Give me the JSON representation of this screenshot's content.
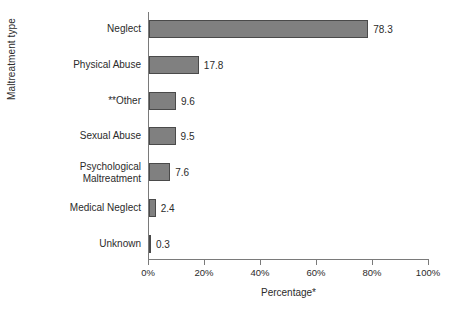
{
  "chart_data": {
    "type": "bar",
    "orientation": "horizontal",
    "title": "",
    "xlabel": "Percentage*",
    "ylabel": "Maltreatment type",
    "categories": [
      "Neglect",
      "Physical Abuse",
      "**Other",
      "Sexual Abuse",
      "Psychological\nMaltreatment",
      "Medical Neglect",
      "Unknown"
    ],
    "values": [
      78.3,
      17.8,
      9.6,
      9.5,
      7.6,
      2.4,
      0.3
    ],
    "value_labels": [
      "78.3",
      "17.8",
      "9.6",
      "9.5",
      "7.6",
      "2.4",
      "0.3"
    ],
    "xlim": [
      0,
      100
    ],
    "xticks": [
      0,
      20,
      40,
      60,
      80,
      100
    ],
    "xtick_labels": [
      "0%",
      "20%",
      "40%",
      "60%",
      "80%",
      "100%"
    ],
    "grid": false,
    "legend": false,
    "bar_color": "#808080",
    "bar_edge_color": "#4a4a4a",
    "axis_color": "#7a7a7a",
    "text_color": "#2b2b2b",
    "background": "#ffffff"
  }
}
